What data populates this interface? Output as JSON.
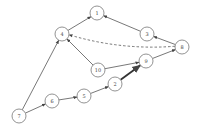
{
  "diagram": {
    "type": "directed-graph",
    "node_radius": 7,
    "colors": {
      "stroke": "#777777",
      "edge": "#555555",
      "label": "#444444",
      "background": "#ffffff"
    },
    "nodes": [
      {
        "id": "1",
        "label": "1",
        "x": 97,
        "y": 13
      },
      {
        "id": "4",
        "label": "4",
        "x": 62,
        "y": 34
      },
      {
        "id": "3",
        "label": "3",
        "x": 147,
        "y": 34
      },
      {
        "id": "8",
        "label": "8",
        "x": 182,
        "y": 47
      },
      {
        "id": "10",
        "label": "10",
        "x": 98,
        "y": 70
      },
      {
        "id": "9",
        "label": "9",
        "x": 146,
        "y": 61
      },
      {
        "id": "2",
        "label": "2",
        "x": 115,
        "y": 84
      },
      {
        "id": "5",
        "label": "5",
        "x": 84,
        "y": 96
      },
      {
        "id": "6",
        "label": "6",
        "x": 52,
        "y": 101
      },
      {
        "id": "7",
        "label": "7",
        "x": 19,
        "y": 116
      }
    ],
    "edges": [
      {
        "from": "4",
        "to": "1",
        "style": "solid"
      },
      {
        "from": "3",
        "to": "1",
        "style": "solid"
      },
      {
        "from": "8",
        "to": "3",
        "style": "solid"
      },
      {
        "from": "8",
        "to": "4",
        "style": "dashed",
        "curved": true
      },
      {
        "from": "10",
        "to": "4",
        "style": "solid"
      },
      {
        "from": "10",
        "to": "9",
        "style": "solid"
      },
      {
        "from": "9",
        "to": "8",
        "style": "solid"
      },
      {
        "from": "2",
        "to": "9",
        "style": "thick"
      },
      {
        "from": "5",
        "to": "2",
        "style": "solid"
      },
      {
        "from": "6",
        "to": "5",
        "style": "solid"
      },
      {
        "from": "7",
        "to": "6",
        "style": "solid"
      },
      {
        "from": "7",
        "to": "4",
        "style": "solid"
      }
    ]
  }
}
